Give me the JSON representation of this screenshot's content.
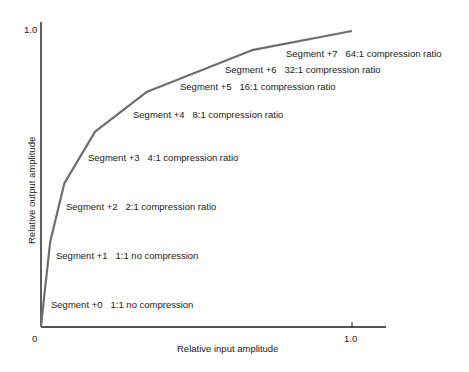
{
  "chart_data": {
    "type": "line",
    "title": "",
    "xlabel": "Relative input amplitude",
    "ylabel": "Relative output amplitude",
    "xlim": [
      0,
      1.0
    ],
    "ylim": [
      0,
      1.0
    ],
    "x_ticks": [
      "0",
      "1.0"
    ],
    "y_ticks": [
      "1.0"
    ],
    "grid": false,
    "series": [
      {
        "name": "Compression curve",
        "x": [
          0.0,
          0.01,
          0.03,
          0.075,
          0.174,
          0.341,
          0.678,
          1.0
        ],
        "y": [
          0.0,
          0.1,
          0.29,
          0.485,
          0.66,
          0.795,
          0.935,
          1.0
        ]
      }
    ],
    "annotations": [
      {
        "segment": "Segment +0",
        "ratio": "1:1 no compression"
      },
      {
        "segment": "Segment +1",
        "ratio": "1:1  no compression"
      },
      {
        "segment": "Segment +2",
        "ratio": "2:1 compression ratio"
      },
      {
        "segment": "Segment +3",
        "ratio": "4:1 compression ratio"
      },
      {
        "segment": "Segment +4",
        "ratio": "8:1 compression ratio"
      },
      {
        "segment": "Segment +5",
        "ratio": "16:1 compression ratio"
      },
      {
        "segment": "Segment +6",
        "ratio": "32:1 compression ratio"
      },
      {
        "segment": "Segment +7",
        "ratio": "64:1 compression ratio"
      }
    ]
  },
  "colors": {
    "curve": "#6e6e6e",
    "axis": "#1a1a1a"
  }
}
